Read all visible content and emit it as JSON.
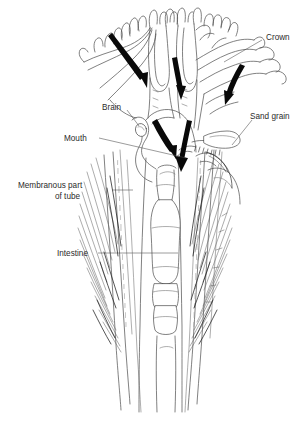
{
  "figure": {
    "background_color": "#ffffff",
    "ink_color": "#4a4a4a",
    "arrow_color": "#090909",
    "text_color": "#2b2b2b"
  },
  "labels": [
    {
      "id": "crown",
      "text": "Crown",
      "x": 266,
      "y": 37,
      "anchor": "start",
      "leader": "M 262,40 L 224,62"
    },
    {
      "id": "sand-grain",
      "text": "Sand grain",
      "x": 250,
      "y": 116,
      "anchor": "start",
      "leader": "M 252,120 L 232,145"
    },
    {
      "id": "brain",
      "text": "Brain",
      "x": 102,
      "y": 107,
      "anchor": "start",
      "leader": "M 127,110 L 139,126"
    },
    {
      "id": "mouth",
      "text": "Mouth",
      "x": 64,
      "y": 139,
      "anchor": "start",
      "leader": "M 99,138 L 186,158"
    },
    {
      "id": "membranous-part-of-tube",
      "text": "Membranous part",
      "text_line2": "of tube",
      "x": 18,
      "y": 190,
      "y2": 201,
      "anchor": "start",
      "leader": "M 112,190 L 133,190"
    },
    {
      "id": "intestine",
      "text": "Intestine",
      "x": 57,
      "y": 255,
      "anchor": "start",
      "leader": "M 98,253 L 178,253"
    }
  ],
  "flow_arrows": [
    {
      "id": "arrow-upper-left",
      "note": "water entering left side of crown"
    },
    {
      "id": "arrow-upper-mid",
      "note": "water descending mid crown"
    },
    {
      "id": "arrow-upper-right",
      "note": "water entering right side of crown"
    },
    {
      "id": "arrow-groove-left",
      "note": "particles travelling down food groove to mouth"
    },
    {
      "id": "arrow-groove-right",
      "note": "particles converging at mouth"
    }
  ],
  "anatomy_parts": [
    "crown-filaments",
    "food-groove",
    "brain",
    "mouth",
    "sand-grain",
    "intestine",
    "membranous-tube-wall",
    "tube-bristles"
  ]
}
